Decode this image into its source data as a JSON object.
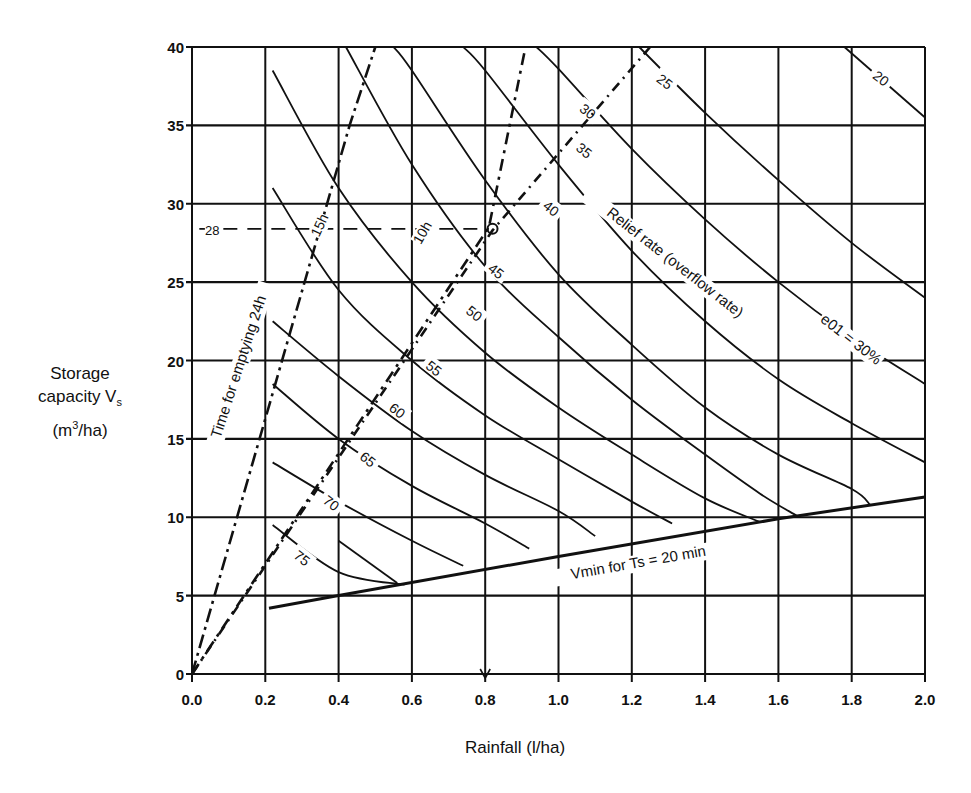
{
  "chart_data": {
    "type": "line",
    "title": "",
    "xlabel": "Rainfall  (l/ha)",
    "ylabel_lines": [
      "Storage",
      "capacity V",
      "(m",
      "/ha)"
    ],
    "ylabel": "Storage capacity Vs (m3/ha)",
    "xlim": [
      0.0,
      2.0
    ],
    "ylim": [
      0,
      40
    ],
    "grid": true,
    "x_ticks": [
      "0.0",
      "0.2",
      "0.4",
      "0.6",
      "0.8",
      "1.0",
      "1.2",
      "1.4",
      "1.6",
      "1.8",
      "2.0"
    ],
    "y_ticks": [
      "0",
      "5",
      "10",
      "15",
      "20",
      "25",
      "30",
      "35",
      "40"
    ],
    "relief_rate_curves": {
      "label": "Relief rate (overflow rate) e01 = 30%",
      "series": [
        {
          "name": "20",
          "points": [
            [
              1.78,
              40
            ],
            [
              2.0,
              35.5
            ]
          ]
        },
        {
          "name": "25",
          "points": [
            [
              1.22,
              40
            ],
            [
              1.4,
              35.8
            ],
            [
              1.6,
              31.5
            ],
            [
              1.8,
              27.5
            ],
            [
              2.0,
              24
            ]
          ]
        },
        {
          "name": "30",
          "points": [
            [
              0.94,
              40
            ],
            [
              1.0,
              38.6
            ],
            [
              1.2,
              33.5
            ],
            [
              1.4,
              29
            ],
            [
              1.6,
              25
            ],
            [
              1.8,
              21.5
            ],
            [
              2.0,
              18.5
            ]
          ]
        },
        {
          "name": "35",
          "points": [
            [
              0.74,
              40
            ],
            [
              0.8,
              38.5
            ],
            [
              1.0,
              32.5
            ],
            [
              1.2,
              27
            ],
            [
              1.4,
              22.5
            ],
            [
              1.6,
              18.8
            ],
            [
              1.8,
              16
            ],
            [
              2.0,
              13.5
            ]
          ]
        },
        {
          "name": "40",
          "points": [
            [
              0.55,
              40
            ],
            [
              0.6,
              38.5
            ],
            [
              0.8,
              31.5
            ],
            [
              1.0,
              25.5
            ],
            [
              1.2,
              21
            ],
            [
              1.4,
              17
            ],
            [
              1.6,
              14
            ],
            [
              1.8,
              11.8
            ],
            [
              1.85,
              10.8
            ]
          ]
        },
        {
          "name": "45",
          "points": [
            [
              0.42,
              40
            ],
            [
              0.6,
              32.5
            ],
            [
              0.8,
              26
            ],
            [
              1.0,
              21.5
            ],
            [
              1.2,
              17.5
            ],
            [
              1.4,
              14
            ],
            [
              1.55,
              11.5
            ],
            [
              1.65,
              10.1
            ]
          ]
        },
        {
          "name": "50",
          "points": [
            [
              0.22,
              38.5
            ],
            [
              0.4,
              31
            ],
            [
              0.6,
              25
            ],
            [
              0.8,
              20.5
            ],
            [
              1.0,
              17
            ],
            [
              1.2,
              14
            ],
            [
              1.4,
              11.2
            ],
            [
              1.55,
              9.7
            ]
          ]
        },
        {
          "name": "55",
          "points": [
            [
              0.22,
              31
            ],
            [
              0.4,
              24.5
            ],
            [
              0.6,
              20
            ],
            [
              0.8,
              16.5
            ],
            [
              1.0,
              13.7
            ],
            [
              1.2,
              11
            ],
            [
              1.31,
              9.6
            ]
          ]
        },
        {
          "name": "60",
          "points": [
            [
              0.22,
              22.5
            ],
            [
              0.4,
              19
            ],
            [
              0.6,
              15.5
            ],
            [
              0.8,
              12.7
            ],
            [
              1.0,
              10.4
            ],
            [
              1.1,
              8.8
            ]
          ]
        },
        {
          "name": "65",
          "points": [
            [
              0.22,
              18.5
            ],
            [
              0.4,
              15
            ],
            [
              0.6,
              12
            ],
            [
              0.8,
              9.6
            ],
            [
              0.92,
              8
            ]
          ]
        },
        {
          "name": "70",
          "points": [
            [
              0.22,
              13.5
            ],
            [
              0.4,
              11
            ],
            [
              0.6,
              8.5
            ],
            [
              0.74,
              6.9
            ]
          ]
        },
        {
          "name": "75",
          "points": [
            [
              0.22,
              9.5
            ],
            [
              0.4,
              6.5
            ],
            [
              0.58,
              5.7
            ]
          ]
        },
        {
          "name": "75b",
          "points": [
            [
              0.4,
              8.5
            ],
            [
              0.56,
              5.8
            ]
          ]
        }
      ]
    },
    "emptying_time_lines": {
      "label": "Time for emptying 24h",
      "series": [
        {
          "name": "24h",
          "points": [
            [
              0,
              0
            ],
            [
              0.43,
              35
            ],
            [
              0.5,
              40
            ]
          ]
        },
        {
          "name": "15h",
          "points": [
            [
              0,
              0
            ],
            [
              0.81,
              28.5
            ],
            [
              0.91,
              40
            ]
          ]
        },
        {
          "name": "10h",
          "points": [
            [
              0,
              0
            ],
            [
              0.82,
              28.3
            ],
            [
              1.25,
              40
            ]
          ]
        }
      ]
    },
    "vmin_line": {
      "label": "Vmin for Ts = 20 min",
      "points": [
        [
          0.21,
          4.2
        ],
        [
          0.4,
          5
        ],
        [
          1.0,
          7.5
        ],
        [
          1.6,
          9.9
        ],
        [
          2.0,
          11.3
        ]
      ]
    },
    "annotations": [
      {
        "text": "28",
        "x": 0.02,
        "y": 28.5
      },
      {
        "text": "15h",
        "x": 0.36,
        "y": 28
      },
      {
        "text": "10h",
        "x": 0.64,
        "y": 27.5
      },
      {
        "text": "Relief rate (overflow rate)",
        "x": 1.3,
        "y": 27
      },
      {
        "text": "e01 = 30%",
        "x": 1.78,
        "y": 20.5
      },
      {
        "text": "Time for emptying 24h",
        "x": 0.12,
        "y": 20
      },
      {
        "text": "Vmin for Ts = 20 min",
        "x": 1.2,
        "y": 7
      }
    ],
    "reference_point": {
      "x": 0.82,
      "y": 28.4,
      "note": "dashed line from y=28 to point, arrow down to x=0.8"
    }
  }
}
